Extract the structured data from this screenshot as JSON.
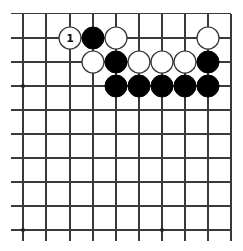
{
  "board": {
    "columns_x": [
      23,
      46,
      70,
      93,
      116,
      139,
      162,
      185,
      208,
      231
    ],
    "rows_y": [
      13.5,
      38,
      62,
      86,
      110,
      134,
      158,
      182,
      206,
      230
    ],
    "line_left_start": 11,
    "line_bottom_end": 241,
    "edges": {
      "top": true,
      "right": true,
      "left": false,
      "bottom": false
    },
    "stone_radius": 11,
    "colors": {
      "line": "#3a3a3a",
      "black": "#000000",
      "white": "#ffffff"
    }
  },
  "star_points": [
    {
      "col": 1,
      "row": 4
    },
    {
      "col": 1,
      "row": 10
    },
    {
      "col": 7,
      "row": 10
    },
    {
      "col": 7,
      "row": 4
    }
  ],
  "stones": [
    {
      "color": "white",
      "col": 3,
      "row": 2,
      "label": "1"
    },
    {
      "color": "black",
      "col": 4,
      "row": 2
    },
    {
      "color": "white",
      "col": 5,
      "row": 2
    },
    {
      "color": "white",
      "col": 9,
      "row": 2
    },
    {
      "color": "white",
      "col": 4,
      "row": 3
    },
    {
      "color": "black",
      "col": 5,
      "row": 3
    },
    {
      "color": "white",
      "col": 6,
      "row": 3
    },
    {
      "color": "white",
      "col": 7,
      "row": 3
    },
    {
      "color": "white",
      "col": 8,
      "row": 3
    },
    {
      "color": "black",
      "col": 9,
      "row": 3
    },
    {
      "color": "black",
      "col": 5,
      "row": 4
    },
    {
      "color": "black",
      "col": 6,
      "row": 4
    },
    {
      "color": "black",
      "col": 7,
      "row": 4
    },
    {
      "color": "black",
      "col": 8,
      "row": 4
    },
    {
      "color": "black",
      "col": 9,
      "row": 4
    }
  ]
}
